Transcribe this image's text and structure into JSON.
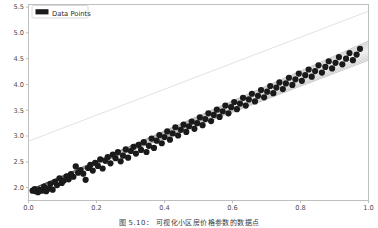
{
  "figure": {
    "caption": "图 5.10： 可视化小区房价格参数的数据点",
    "background_color": "#ffffff"
  },
  "legend": {
    "label": "Data Points",
    "swatch_color": "#1a1a1a",
    "position": "upper-left",
    "border_color": "#cfcfcf"
  },
  "chart_data": {
    "type": "scatter",
    "title": "",
    "xlabel": "",
    "ylabel": "",
    "xlim": [
      0.0,
      1.0
    ],
    "ylim": [
      1.75,
      5.55
    ],
    "xticks": [
      0.0,
      0.2,
      0.4,
      0.6,
      0.8,
      1.0
    ],
    "xtick_labels": [
      "0.0",
      "0.2",
      "0.4",
      "0.6",
      "0.8",
      "1.0"
    ],
    "yticks": [
      2.0,
      2.5,
      3.0,
      3.5,
      4.0,
      4.5,
      5.0,
      5.5
    ],
    "ytick_labels": [
      "2.0",
      "2.5",
      "3.0",
      "3.5",
      "4.0",
      "4.5",
      "5.0",
      "5.5"
    ],
    "grid": false,
    "legend_position": "upper left",
    "point_color": "#1a1a1a",
    "point_size": 3.1,
    "series": [
      {
        "name": "Data Points",
        "marker": "circle",
        "color": "#1a1a1a",
        "x": [
          0.012,
          0.018,
          0.021,
          0.028,
          0.033,
          0.039,
          0.046,
          0.052,
          0.058,
          0.064,
          0.071,
          0.078,
          0.084,
          0.091,
          0.098,
          0.104,
          0.112,
          0.118,
          0.125,
          0.132,
          0.139,
          0.146,
          0.153,
          0.161,
          0.168,
          0.175,
          0.182,
          0.189,
          0.196,
          0.204,
          0.211,
          0.218,
          0.226,
          0.233,
          0.241,
          0.248,
          0.256,
          0.263,
          0.271,
          0.278,
          0.286,
          0.293,
          0.301,
          0.309,
          0.316,
          0.324,
          0.331,
          0.339,
          0.347,
          0.354,
          0.362,
          0.369,
          0.377,
          0.385,
          0.392,
          0.4,
          0.408,
          0.416,
          0.424,
          0.432,
          0.44,
          0.448,
          0.456,
          0.464,
          0.472,
          0.48,
          0.488,
          0.496,
          0.504,
          0.512,
          0.52,
          0.529,
          0.537,
          0.545,
          0.554,
          0.562,
          0.571,
          0.579,
          0.588,
          0.596,
          0.605,
          0.613,
          0.622,
          0.631,
          0.639,
          0.648,
          0.657,
          0.666,
          0.675,
          0.684,
          0.693,
          0.702,
          0.711,
          0.72,
          0.729,
          0.738,
          0.748,
          0.757,
          0.766,
          0.776,
          0.785,
          0.795,
          0.804,
          0.814,
          0.824,
          0.833,
          0.843,
          0.853,
          0.863,
          0.873,
          0.883,
          0.893,
          0.903,
          0.913,
          0.923,
          0.934,
          0.944,
          0.954,
          0.965,
          0.975
        ],
        "y": [
          1.94,
          1.97,
          1.93,
          1.91,
          1.96,
          1.94,
          2.02,
          1.93,
          1.98,
          2.07,
          1.96,
          2.11,
          2.05,
          2.18,
          2.09,
          2.14,
          2.22,
          2.16,
          2.26,
          2.21,
          2.41,
          2.29,
          2.34,
          2.27,
          2.15,
          2.38,
          2.44,
          2.33,
          2.48,
          2.42,
          2.55,
          2.37,
          2.52,
          2.59,
          2.47,
          2.64,
          2.57,
          2.69,
          2.51,
          2.62,
          2.74,
          2.58,
          2.71,
          2.79,
          2.66,
          2.83,
          2.73,
          2.88,
          2.69,
          2.81,
          2.95,
          2.77,
          2.91,
          3.02,
          2.86,
          2.98,
          3.09,
          2.93,
          3.05,
          3.17,
          3.01,
          3.12,
          3.22,
          3.08,
          3.19,
          3.28,
          3.14,
          3.25,
          3.36,
          3.21,
          3.33,
          3.44,
          3.29,
          3.41,
          3.51,
          3.37,
          3.48,
          3.59,
          3.44,
          3.56,
          3.66,
          3.52,
          3.63,
          3.74,
          3.59,
          3.71,
          3.82,
          3.67,
          3.78,
          3.89,
          3.75,
          3.86,
          3.97,
          3.83,
          3.94,
          4.04,
          3.91,
          4.02,
          4.13,
          3.99,
          4.1,
          4.21,
          4.07,
          4.18,
          4.29,
          4.15,
          4.26,
          4.37,
          4.23,
          4.34,
          4.45,
          4.31,
          4.42,
          4.53,
          4.39,
          4.5,
          4.61,
          4.47,
          4.58,
          4.69
        ]
      }
    ],
    "regression_fan": {
      "description": "bundle of candidate regression lines converging near lower-left and fanning out toward upper-right",
      "color": "#555555",
      "n_lines": 14,
      "pivot_x": 0.02,
      "pivot_y": 2.0,
      "slope_min": 2.52,
      "slope_max": 2.9
    },
    "reference_line": {
      "description": "faint light-gray reference line above the data cloud",
      "color": "#e2e2e2",
      "x0": 0.0,
      "y0": 2.9,
      "x1": 1.0,
      "y1": 5.42
    }
  }
}
